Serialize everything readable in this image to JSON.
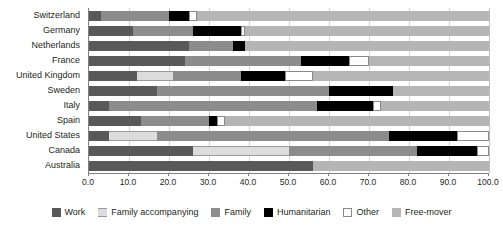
{
  "chart_data": {
    "type": "bar",
    "orientation": "horizontal",
    "stacked": true,
    "stack_mode": "percent",
    "title": "",
    "subtitle": "",
    "xlabel": "",
    "ylabel": "",
    "xlim": [
      0.0,
      100.0
    ],
    "xticks": [
      "0.0",
      "10.0",
      "20.0",
      "30.0",
      "40.0",
      "50.0",
      "60.0",
      "70.0",
      "80.0",
      "90.0",
      "100.0"
    ],
    "grid": true,
    "legend_position": "bottom",
    "categories": [
      "Switzerland",
      "Germany",
      "Netherlands",
      "France",
      "United Kingdom",
      "Sweden",
      "Italy",
      "Spain",
      "United States",
      "Canada",
      "Australia"
    ],
    "series": [
      {
        "name": "Work",
        "color": "#595959",
        "values": [
          3.0,
          11.0,
          25.0,
          24.0,
          12.0,
          17.0,
          5.0,
          13.0,
          5.0,
          26.0,
          56.0
        ]
      },
      {
        "name": "Family accompanying",
        "color": "#dcdcdc",
        "values": [
          0.0,
          0.0,
          0.0,
          0.0,
          9.0,
          0.0,
          0.0,
          0.0,
          12.0,
          24.0,
          0.0
        ]
      },
      {
        "name": "Family",
        "color": "#8c8c8c",
        "values": [
          17.0,
          15.0,
          11.0,
          29.0,
          17.0,
          43.0,
          52.0,
          17.0,
          58.0,
          32.0,
          0.0
        ]
      },
      {
        "name": "Humanitarian",
        "color": "#000000",
        "values": [
          5.0,
          12.0,
          3.0,
          12.0,
          11.0,
          16.0,
          14.0,
          2.0,
          17.0,
          15.0,
          0.0
        ]
      },
      {
        "name": "Other",
        "color": "#ffffff",
        "values": [
          2.0,
          1.0,
          0.0,
          5.0,
          7.0,
          0.0,
          2.0,
          2.0,
          8.0,
          3.0,
          0.0
        ]
      },
      {
        "name": "Free-mover",
        "color": "#b5b5b5",
        "values": [
          73.0,
          61.0,
          61.0,
          30.0,
          44.0,
          24.0,
          27.0,
          66.0,
          0.0,
          0.0,
          44.0
        ]
      }
    ]
  },
  "legend": {
    "items": [
      {
        "label": "Work",
        "swatch_class": "s-work",
        "icon": "swatch-work"
      },
      {
        "label": "Family accompanying",
        "swatch_class": "s-famacc",
        "icon": "swatch-family-accompanying"
      },
      {
        "label": "Family",
        "swatch_class": "s-family",
        "icon": "swatch-family"
      },
      {
        "label": "Humanitarian",
        "swatch_class": "s-humanitarian",
        "icon": "swatch-humanitarian"
      },
      {
        "label": "Other",
        "swatch_class": "s-other",
        "icon": "swatch-other"
      },
      {
        "label": "Free-mover",
        "swatch_class": "s-freemover",
        "icon": "swatch-free-mover"
      }
    ]
  }
}
